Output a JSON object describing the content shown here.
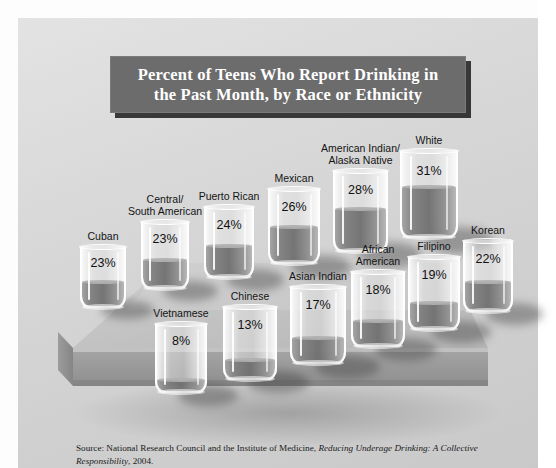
{
  "title": {
    "line1": "Percent of Teens Who Report Drinking in",
    "line2": "the Past Month, by Race or Ethnicity"
  },
  "source": {
    "prefix": "Source: National Research Council and the Institute of Medicine, ",
    "italic": "Reducing Underage Drinking: A Collective Responsibility",
    "suffix": ", 2004."
  },
  "chart_data": {
    "type": "bar",
    "title": "Percent of Teens Who Report Drinking in the Past Month, by Race or Ethnicity",
    "xlabel": "Race or Ethnicity",
    "ylabel": "Percent reporting drinking in past month",
    "ylim": [
      0,
      35
    ],
    "unit": "%",
    "grid": false,
    "legend": "none",
    "note": "Values rendered as fill level in drinking-glass pictograms arranged in two rows on a 3D platform",
    "categories": [
      "Cuban",
      "Central/South American",
      "Puerto Rican",
      "Mexican",
      "American Indian/Alaska Native",
      "White",
      "Vietnamese",
      "Chinese",
      "Asian Indian",
      "African American",
      "Filipino",
      "Korean"
    ],
    "values": [
      23,
      23,
      24,
      26,
      28,
      31,
      8,
      13,
      17,
      18,
      19,
      22
    ]
  },
  "glasses": [
    {
      "label": "Cuban",
      "label_line2": "",
      "pct": "23%",
      "fill": 0.42
    },
    {
      "label": "Central/",
      "label_line2": "South American",
      "pct": "23%",
      "fill": 0.42
    },
    {
      "label": "Puerto Rican",
      "label_line2": "",
      "pct": "24%",
      "fill": 0.44
    },
    {
      "label": "Mexican",
      "label_line2": "",
      "pct": "26%",
      "fill": 0.48
    },
    {
      "label": "American Indian/",
      "label_line2": "Alaska Native",
      "pct": "28%",
      "fill": 0.52
    },
    {
      "label": "White",
      "label_line2": "",
      "pct": "31%",
      "fill": 0.58
    },
    {
      "label": "Vietnamese",
      "label_line2": "",
      "pct": "8%",
      "fill": 0.16
    },
    {
      "label": "Chinese",
      "label_line2": "",
      "pct": "13%",
      "fill": 0.25
    },
    {
      "label": "Asian Indian",
      "label_line2": "",
      "pct": "17%",
      "fill": 0.32
    },
    {
      "label": "African",
      "label_line2": "American",
      "pct": "18%",
      "fill": 0.34
    },
    {
      "label": "Filipino",
      "label_line2": "",
      "pct": "19%",
      "fill": 0.36
    },
    {
      "label": "Korean",
      "label_line2": "",
      "pct": "22%",
      "fill": 0.41
    }
  ],
  "colors": {
    "panel_bg": "#d8d8d8",
    "title_bar": "#6c6c6c",
    "title_text": "#ffffff",
    "platform_top": "#c4c4c4",
    "platform_front": "#9a9a9a",
    "liquid": "#6c6c6c",
    "label_text": "#141414"
  }
}
